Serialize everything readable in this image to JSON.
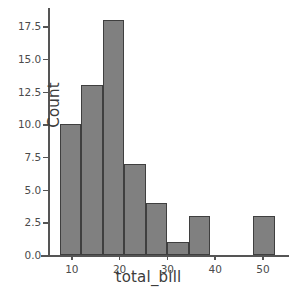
{
  "chart_data": {
    "type": "bar",
    "subtype": "histogram",
    "title": "",
    "xlabel": "total_bill",
    "ylabel": "Count",
    "xlim": [
      5.0,
      54.0
    ],
    "ylim": [
      0.0,
      18.9
    ],
    "grid": false,
    "legend": null,
    "bar_color": "#808080",
    "edge_color": "#3f3f3f",
    "axis_color": "#555555",
    "background": "#ffffff",
    "bin_edges": [
      7.5,
      12.0,
      16.5,
      21.0,
      25.5,
      30.0,
      34.5,
      39.0,
      43.5,
      48.0,
      52.5
    ],
    "categories": [
      "7.5-12",
      "12-16.5",
      "16.5-21",
      "21-25.5",
      "25.5-30",
      "30-34.5",
      "34.5-39",
      "39-43.5",
      "43.5-48",
      "48-52.5"
    ],
    "values": [
      10,
      13,
      18,
      7,
      4,
      1,
      3,
      0,
      0,
      3
    ],
    "xticks": [
      10,
      20,
      30,
      40,
      50
    ],
    "xtick_labels": [
      "10",
      "20",
      "30",
      "40",
      "50"
    ],
    "yticks": [
      0.0,
      2.5,
      5.0,
      7.5,
      10.0,
      12.5,
      15.0,
      17.5
    ],
    "ytick_labels": [
      "0.0",
      "2.5",
      "5.0",
      "7.5",
      "10.0",
      "12.5",
      "15.0",
      "17.5"
    ]
  }
}
